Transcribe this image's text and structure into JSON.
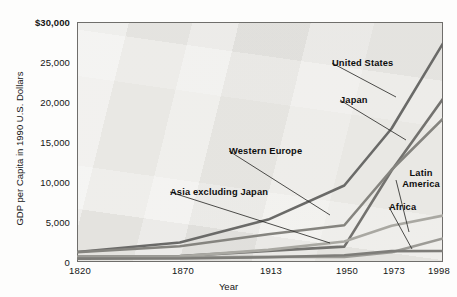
{
  "chart_data": {
    "type": "line",
    "title": "",
    "xlabel": "Year",
    "ylabel": "GDP per Capita in 1990 U.S. Dollars",
    "categories": [
      "1820",
      "1870",
      "1913",
      "1950",
      "1973",
      "1998"
    ],
    "category_positions": [
      0,
      50,
      93,
      130,
      153,
      178
    ],
    "ylim": [
      0,
      30000
    ],
    "ytick_values": [
      0,
      5000,
      10000,
      15000,
      20000,
      25000,
      30000
    ],
    "ytick_labels": [
      "0",
      "5,000",
      "10,000",
      "15,000",
      "20,000",
      "25,000",
      "$30,000"
    ],
    "grid": false,
    "legend": "inline-callouts",
    "series": [
      {
        "name": "United States",
        "color": "#6a6a68",
        "values": [
          1257,
          2445,
          5301,
          9561,
          16689,
          27331
        ]
      },
      {
        "name": "Japan",
        "color": "#73726f",
        "values": [
          669,
          737,
          1387,
          1926,
          11439,
          20413
        ]
      },
      {
        "name": "Western Europe",
        "color": "#85847f",
        "values": [
          1232,
          1974,
          3473,
          4594,
          11534,
          17921
        ]
      },
      {
        "name": "Latin America",
        "color": "#a9a8a2",
        "values": [
          665,
          698,
          1511,
          2554,
          4531,
          5795
        ]
      },
      {
        "name": "Asia excluding Japan",
        "color": "#9c9b96",
        "values": [
          575,
          543,
          640,
          635,
          1231,
          2936
        ]
      },
      {
        "name": "Africa",
        "color": "#7e7d79",
        "values": [
          418,
          444,
          585,
          852,
          1365,
          1368
        ]
      }
    ],
    "annotations": [
      {
        "label": "United States",
        "x": 332,
        "y": 63,
        "lead_to_x": 396,
        "lead_to_y": 97
      },
      {
        "label": "Japan",
        "x": 340,
        "y": 100,
        "lead_to_x": 406,
        "lead_to_y": 140
      },
      {
        "label": "Western Europe",
        "x": 229,
        "y": 151,
        "lead_to_x": 330,
        "lead_to_y": 215
      },
      {
        "label": "Asia excluding Japan",
        "x": 170,
        "y": 192,
        "lead_to_x": 330,
        "lead_to_y": 243
      },
      {
        "label": "Latin America",
        "x": 396,
        "y": 180,
        "lead_to_x": 409,
        "lead_to_y": 232
      },
      {
        "label": "Africa",
        "x": 389,
        "y": 207,
        "lead_to_x": 412,
        "lead_to_y": 249
      }
    ]
  }
}
